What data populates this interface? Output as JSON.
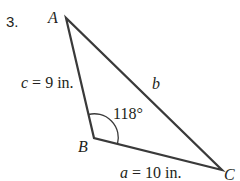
{
  "problem": {
    "number": "3."
  },
  "triangle": {
    "vertices": [
      {
        "name": "A",
        "x": 66,
        "y": 18
      },
      {
        "name": "B",
        "x": 94,
        "y": 138
      },
      {
        "name": "C",
        "x": 222,
        "y": 170
      }
    ],
    "labels": {
      "A": "A",
      "B": "B",
      "C": "C"
    },
    "sides": {
      "c": {
        "var": "c",
        "eq": " = 9 in."
      },
      "b": {
        "var": "b"
      },
      "a": {
        "var": "a",
        "eq": " = 10 in."
      }
    },
    "angle_B": "118°",
    "stroke_color": "#3a3a3a"
  }
}
